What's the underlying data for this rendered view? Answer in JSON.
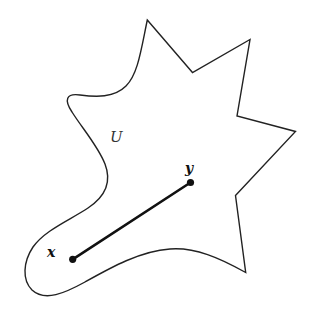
{
  "diagram": {
    "title": "",
    "region": {
      "label": "U",
      "stroke_color": "#222222",
      "fill_color": "#ffffff",
      "stroke_width": 1.4
    },
    "points": [
      {
        "id": "x",
        "label": "x",
        "cx": 72.7,
        "cy": 259.3
      },
      {
        "id": "y",
        "label": "y",
        "cx": 190.5,
        "cy": 182.5
      }
    ],
    "segment": {
      "from": "x",
      "to": "y",
      "stroke_color": "#111111",
      "stroke_width": 2.6
    },
    "labels": {
      "region_label": "U",
      "point_x_label": "x",
      "point_y_label": "y"
    }
  }
}
